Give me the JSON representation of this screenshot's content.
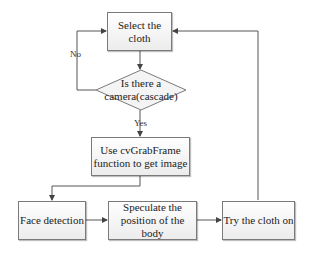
{
  "nodes": {
    "select": {
      "label": "Select the cloth",
      "line1": "Select the",
      "line2": "cloth"
    },
    "decision": {
      "line1": "Is there a",
      "line2": "camera(cascade)"
    },
    "grab": {
      "line1": "Use cvGrabFrame",
      "line2": "function to get image"
    },
    "face": {
      "label": "Face detection"
    },
    "speculate": {
      "line1": "Speculate the",
      "line2": "position of the body"
    },
    "try": {
      "label": "Try the cloth on"
    }
  },
  "edges": {
    "no_label": "No",
    "yes_label": "Yes"
  },
  "colors": {
    "stroke": "#555555",
    "box_border": "#7a7a7a",
    "box_fill": "#f2f2f2"
  }
}
